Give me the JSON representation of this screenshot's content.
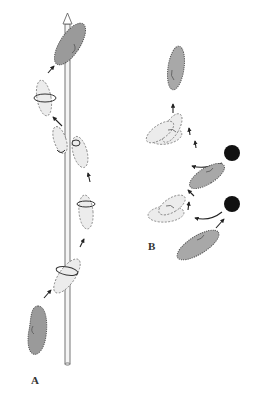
{
  "figure": {
    "panels": [
      {
        "id": "A",
        "label": "A",
        "content": "Paramecium swimming in a spiral path around a vertical rod axis, rotating as it moves upward"
      },
      {
        "id": "B",
        "label": "B",
        "content": "Avoidance reaction: paramecium collides with obstacles (black dots), backs up, turns, and moves forward in a new direction"
      }
    ],
    "colors": {
      "cell_fill": "#9a9a9a",
      "ghost_fill": "#ececec",
      "obstacle": "#111111",
      "rod": "#f4f4f4"
    }
  }
}
